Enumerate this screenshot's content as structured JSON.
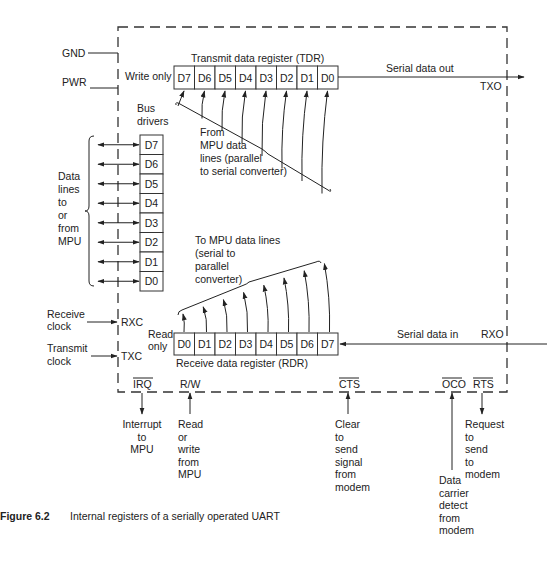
{
  "diagram": {
    "caption": {
      "label": "Figure 6.2",
      "text": "Internal registers of a serially operated UART"
    },
    "power_pins": {
      "gnd": "GND",
      "pwr": "PWR"
    },
    "tdr": {
      "title": "Transmit data register (TDR)",
      "access": "Write only",
      "cells": [
        "D7",
        "D6",
        "D5",
        "D4",
        "D3",
        "D2",
        "D1",
        "D0"
      ],
      "input_note": [
        "From",
        "MPU data",
        "lines (parallel",
        "to serial converter)"
      ],
      "output_label": "Serial data out",
      "pin": "TXO"
    },
    "bus_drivers": {
      "title": [
        "Bus",
        "drivers"
      ],
      "cells": [
        "D7",
        "D6",
        "D5",
        "D4",
        "D3",
        "D2",
        "D1",
        "D0"
      ],
      "side_label": [
        "Data",
        "lines",
        "to",
        "or",
        "from",
        "MPU"
      ]
    },
    "rdr": {
      "title": "Receive data register (RDR)",
      "access": [
        "Read",
        "only"
      ],
      "cells": [
        "D0",
        "D1",
        "D2",
        "D3",
        "D4",
        "D5",
        "D6",
        "D7"
      ],
      "output_note": [
        "To MPU data lines",
        "(serial to",
        "parallel",
        "converter)"
      ],
      "input_label": "Serial data in",
      "pin": "RXO"
    },
    "clocks": {
      "rx": {
        "label": [
          "Receive",
          "clock"
        ],
        "pin": "RXC"
      },
      "tx": {
        "label": [
          "Transmit",
          "clock"
        ],
        "pin": "TXC"
      }
    },
    "bottom_pins": [
      {
        "pin": "IRQ",
        "overline": true,
        "direction": "out",
        "desc": [
          "Interrupt",
          "to",
          "MPU"
        ]
      },
      {
        "pin": "R/W",
        "overline": false,
        "direction": "in",
        "desc": [
          "Read",
          "or",
          "write",
          "from",
          "MPU"
        ]
      },
      {
        "pin": "CTS",
        "overline": true,
        "direction": "in",
        "desc": [
          "Clear",
          "to",
          "send",
          "signal",
          "from",
          "modem"
        ]
      },
      {
        "pin": "OCO",
        "overline": true,
        "direction": "in",
        "desc": [
          "Data",
          "carrier",
          "detect",
          "from",
          "modem"
        ]
      },
      {
        "pin": "RTS",
        "overline": true,
        "direction": "out",
        "desc": [
          "Request",
          "to",
          "send",
          "to",
          "modem"
        ]
      }
    ]
  }
}
